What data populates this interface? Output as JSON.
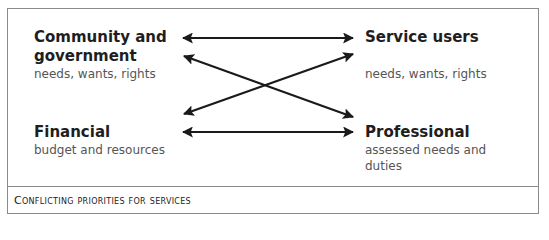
{
  "diagram": {
    "nodes": [
      {
        "id": "community",
        "title_lines": [
          "Community and",
          "government"
        ],
        "subtitle": "needs, wants, rights"
      },
      {
        "id": "service_users",
        "title": "Service users",
        "subtitle": "needs, wants, rights"
      },
      {
        "id": "financial",
        "title": "Financial",
        "subtitle": "budget and resources"
      },
      {
        "id": "professional",
        "title": "Professional",
        "subtitle_lines": [
          "assessed needs and",
          "duties"
        ]
      }
    ],
    "edges": [
      {
        "from": "community",
        "to": "service_users",
        "type": "bidirectional"
      },
      {
        "from": "community",
        "to": "professional",
        "type": "bidirectional"
      },
      {
        "from": "financial",
        "to": "service_users",
        "type": "bidirectional"
      },
      {
        "from": "financial",
        "to": "professional",
        "type": "bidirectional"
      }
    ],
    "caption": "Conflicting priorities for services",
    "colors": {
      "border": "#8a8a8a",
      "arrow": "#1a1a1a",
      "title": "#1e1e1e",
      "subtitle": "#555555"
    }
  }
}
